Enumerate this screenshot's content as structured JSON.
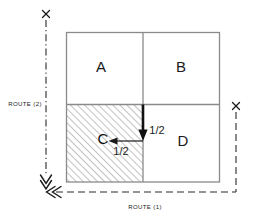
{
  "diagram": {
    "quadrants": [
      {
        "id": "A",
        "label": "A",
        "position": "top-left",
        "hatched": false
      },
      {
        "id": "B",
        "label": "B",
        "position": "top-right",
        "hatched": false
      },
      {
        "id": "C",
        "label": "C",
        "position": "bottom-left",
        "hatched": true
      },
      {
        "id": "D",
        "label": "D",
        "position": "bottom-right",
        "hatched": false
      }
    ],
    "flow_arrows": [
      {
        "id": "vertical-flow",
        "label": "1/2",
        "direction": "down"
      },
      {
        "id": "horizontal-flow",
        "label": "1/2",
        "direction": "left"
      }
    ],
    "routes": [
      {
        "id": "route-2",
        "label": "ROUTE (2)",
        "orientation": "vertical",
        "line_style": "dash-dot",
        "terminal_marker": "x",
        "arrow_marker": "double-chevron"
      },
      {
        "id": "route-1",
        "label": "ROUTE (1)",
        "orientation": "horizontal",
        "line_style": "dashed",
        "terminal_marker": "x",
        "arrow_marker": "double-chevron"
      }
    ],
    "markers": [
      {
        "id": "marker-top-left",
        "glyph": "x"
      },
      {
        "id": "marker-right",
        "glyph": "x"
      }
    ],
    "colors": {
      "box_stroke": "#8a8a8a",
      "bold_arrow": "#111111",
      "thin_arrow": "#1a1a1a",
      "route_line": "#2b2b2b",
      "hatch": "#8f8f8f",
      "text": "#1a1a1a",
      "background": "#ffffff"
    }
  }
}
